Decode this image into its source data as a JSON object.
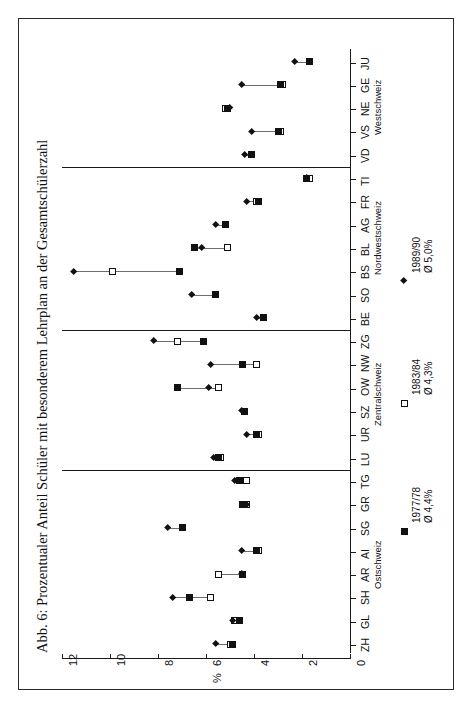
{
  "figure": {
    "title": "Abb. 6: Prozentualer Anteil Schüler mit besonderem Lehrplan an der Gesamtschülerzahl"
  },
  "axis": {
    "value_title": "%",
    "ticks": [
      "0",
      "2",
      "4",
      "6",
      "8",
      "10",
      "12"
    ]
  },
  "legend": [
    {
      "marker": "filled-square",
      "period": "1977/78",
      "mean": "Ø 4,4%"
    },
    {
      "marker": "open-square",
      "period": "1983/84",
      "mean": "Ø 4,3%"
    },
    {
      "marker": "diamond",
      "period": "1989/90",
      "mean": "Ø 5,0%"
    }
  ],
  "groups": [
    {
      "label": "Ostschweiz",
      "from": "ZH",
      "to": "LU"
    },
    {
      "label": "Zentralschweiz",
      "from": "LU",
      "to": "BE"
    },
    {
      "label": "Nordwestschweiz",
      "from": "BE",
      "to": "TI"
    },
    {
      "label": "Westschweiz",
      "from": "TI",
      "to": "JU"
    }
  ],
  "chart_data": {
    "type": "scatter",
    "title": "Abb. 6: Prozentualer Anteil Schüler mit besonderem Lehrplan an der Gesamtschülerzahl",
    "orientation": "horizontal-categories-vertical-axis",
    "xlabel": "%",
    "ylabel": "",
    "xlim": [
      0,
      12
    ],
    "grid": false,
    "legend_position": "right",
    "categories": [
      "ZH",
      "GL",
      "SH",
      "AR",
      "AI",
      "SG",
      "GR",
      "TG",
      "LU",
      "UR",
      "SZ",
      "OW",
      "NW",
      "ZG",
      "BE",
      "SO",
      "BS",
      "BL",
      "AG",
      "FR",
      "TI",
      "VD",
      "VS",
      "NE",
      "GE",
      "JU"
    ],
    "series": [
      {
        "name": "1977/78",
        "marker": "filled-square",
        "mean": 4.4,
        "values": [
          4.9,
          4.6,
          6.7,
          4.5,
          3.9,
          7.0,
          4.5,
          4.6,
          5.5,
          3.9,
          4.4,
          7.2,
          4.5,
          6.1,
          3.6,
          5.6,
          7.1,
          6.5,
          5.2,
          3.8,
          1.8,
          4.1,
          3.0,
          5.1,
          2.9,
          1.7
        ]
      },
      {
        "name": "1983/84",
        "marker": "open-square",
        "mean": 4.3,
        "values": [
          5.0,
          4.8,
          5.8,
          5.5,
          3.8,
          7.0,
          4.3,
          4.3,
          5.4,
          3.8,
          4.4,
          5.5,
          3.9,
          7.2,
          3.6,
          5.6,
          9.9,
          5.1,
          5.2,
          3.9,
          1.7,
          4.1,
          2.9,
          5.2,
          2.8,
          1.7
        ]
      },
      {
        "name": "1989/90",
        "marker": "diamond",
        "mean": 5.0,
        "values": [
          5.6,
          4.9,
          7.4,
          4.5,
          4.5,
          7.6,
          4.3,
          4.8,
          5.7,
          4.3,
          4.5,
          5.9,
          5.8,
          8.2,
          3.9,
          6.6,
          11.5,
          6.2,
          5.6,
          4.3,
          1.8,
          4.4,
          4.1,
          5.0,
          4.5,
          2.3
        ]
      }
    ]
  }
}
